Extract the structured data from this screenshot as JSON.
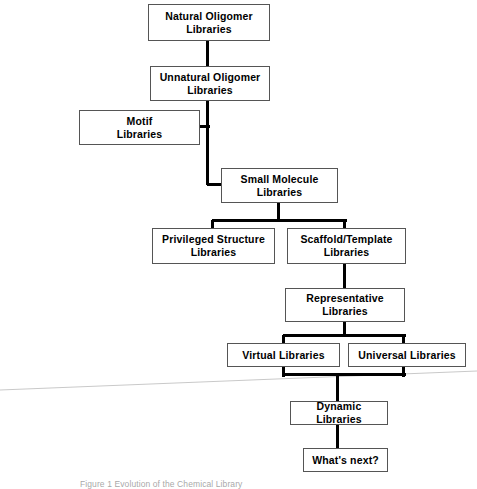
{
  "figure": {
    "type": "flowchart",
    "orientation": "top-to-bottom",
    "background_color": "#ffffff",
    "line_color": "#000000",
    "box_border_color": "#555555",
    "caption": "Figure 1 Evolution of the Chemical Library"
  },
  "nodes": [
    {
      "id": "natural_oligomer",
      "label": "Natural Oligomer\nLibraries",
      "x": 148,
      "y": 4,
      "w": 122,
      "h": 37
    },
    {
      "id": "unnatural_oligomer",
      "label": "Unnatural Oligomer\nLibraries",
      "x": 150,
      "y": 66,
      "w": 120,
      "h": 35
    },
    {
      "id": "motif",
      "label": "Motif\nLibraries",
      "x": 79,
      "y": 110,
      "w": 121,
      "h": 35
    },
    {
      "id": "small_molecule",
      "label": "Small Molecule\nLibraries",
      "x": 221,
      "y": 168,
      "w": 117,
      "h": 35
    },
    {
      "id": "privileged_structure",
      "label": "Privileged Structure\nLibraries",
      "x": 152,
      "y": 228,
      "w": 123,
      "h": 36
    },
    {
      "id": "scaffold_template",
      "label": "Scaffold/Template\nLibraries",
      "x": 287,
      "y": 228,
      "w": 119,
      "h": 36
    },
    {
      "id": "representative",
      "label": "Representative\nLibraries",
      "x": 285,
      "y": 288,
      "w": 120,
      "h": 34
    },
    {
      "id": "virtual",
      "label": "Virtual Libraries",
      "x": 227,
      "y": 343,
      "w": 113,
      "h": 24
    },
    {
      "id": "universal",
      "label": "Universal Libraries",
      "x": 348,
      "y": 343,
      "w": 118,
      "h": 24
    },
    {
      "id": "dynamic",
      "label": "Dynamic Libraries",
      "x": 290,
      "y": 401,
      "w": 98,
      "h": 24
    },
    {
      "id": "whats_next",
      "label": "What's next?",
      "x": 303,
      "y": 448,
      "w": 85,
      "h": 24
    }
  ],
  "connectors": [
    {
      "id": "natural-to-unnatural",
      "orient": "v",
      "x": 207,
      "y": 41,
      "len": 25,
      "thick": 3
    },
    {
      "id": "unnatural-down-trunk",
      "orient": "v",
      "x": 207,
      "y": 101,
      "len": 84,
      "thick": 3
    },
    {
      "id": "motif-join-stub",
      "orient": "h",
      "x": 200,
      "y": 126,
      "len": 10,
      "thick": 3
    },
    {
      "id": "trunk-to-small-molecule",
      "orient": "h",
      "x": 207,
      "y": 184,
      "len": 17,
      "thick": 3
    },
    {
      "id": "small-molecule-down",
      "orient": "v",
      "x": 278,
      "y": 203,
      "len": 19,
      "thick": 3
    },
    {
      "id": "split-bar-level3",
      "orient": "h",
      "x": 212,
      "y": 220,
      "len": 135,
      "thick": 3
    },
    {
      "id": "drop-privileged",
      "orient": "v",
      "x": 212,
      "y": 220,
      "len": 9,
      "thick": 3
    },
    {
      "id": "drop-scaffold",
      "orient": "v",
      "x": 344,
      "y": 220,
      "len": 9,
      "thick": 3
    },
    {
      "id": "scaffold-to-representative",
      "orient": "v",
      "x": 344,
      "y": 264,
      "len": 25,
      "thick": 3
    },
    {
      "id": "representative-down",
      "orient": "v",
      "x": 344,
      "y": 322,
      "len": 14,
      "thick": 3
    },
    {
      "id": "loop-top-bar",
      "orient": "h",
      "x": 283,
      "y": 335,
      "len": 123,
      "thick": 3
    },
    {
      "id": "loop-left-side",
      "orient": "v",
      "x": 283,
      "y": 335,
      "len": 42,
      "thick": 3
    },
    {
      "id": "loop-right-side",
      "orient": "v",
      "x": 403,
      "y": 335,
      "len": 42,
      "thick": 3
    },
    {
      "id": "loop-bottom-bar",
      "orient": "h",
      "x": 283,
      "y": 374,
      "len": 123,
      "thick": 3
    },
    {
      "id": "loop-to-dynamic",
      "orient": "v",
      "x": 337,
      "y": 374,
      "len": 27,
      "thick": 3
    },
    {
      "id": "dynamic-to-whats-next",
      "orient": "v",
      "x": 337,
      "y": 425,
      "len": 23,
      "thick": 3
    }
  ],
  "artifact": {
    "name": "scan-edge-line",
    "color": "#c9c9c9",
    "x1": 0,
    "y1": 390,
    "x2": 477,
    "y2": 371
  }
}
